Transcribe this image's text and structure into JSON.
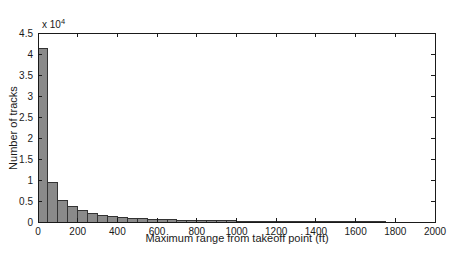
{
  "figure": {
    "background": "#ffffff",
    "colors": {
      "bar_fill": "#8a8a8a",
      "bar_edge": "#333333",
      "axis": "#1a1a1a",
      "text": "#1a1a1a"
    }
  },
  "chart_data": {
    "type": "bar",
    "title": "",
    "xlabel": "Maximum range from takeoff point (ft)",
    "ylabel": "Number of tracks",
    "y_scale_label": "x 10",
    "y_scale_exponent": "4",
    "y_units_multiplier": 10000,
    "xlim": [
      0,
      2000
    ],
    "ylim_x1e4": [
      0,
      4.5
    ],
    "xticks": [
      0,
      200,
      400,
      600,
      800,
      1000,
      1200,
      1400,
      1600,
      1800,
      2000
    ],
    "yticks_x1e4": [
      0,
      0.5,
      1,
      1.5,
      2,
      2.5,
      3,
      3.5,
      4,
      4.5
    ],
    "bin_start_ft": 0,
    "bin_width_ft": 50,
    "values_x1e4": [
      4.13,
      0.93,
      0.52,
      0.36,
      0.27,
      0.21,
      0.16,
      0.13,
      0.105,
      0.09,
      0.08,
      0.068,
      0.058,
      0.05,
      0.045,
      0.04,
      0.035,
      0.031,
      0.028,
      0.025,
      0.022,
      0.019,
      0.016,
      0.013,
      0.011,
      0.009,
      0.007,
      0.005,
      0.004,
      0.003,
      0.002,
      0.002,
      0.001,
      0.001,
      0.001,
      0,
      0,
      0,
      0,
      0
    ],
    "grid": false,
    "legend": null,
    "box": true,
    "tick_direction": "in"
  }
}
